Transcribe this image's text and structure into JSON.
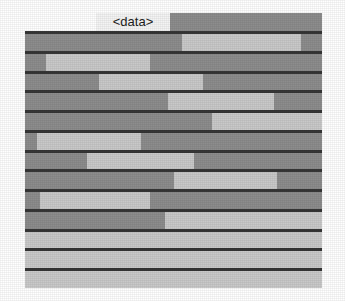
{
  "figure": {
    "label": "<data>",
    "colors": {
      "background": "#ffffff",
      "bar_dark": "#8d8d8d",
      "bar_light": "#c9c9c9",
      "separator": "#363636",
      "label_text": "#1c1c1c",
      "label_background": "#f4f4f4"
    }
  },
  "chart_data": {
    "type": "bar",
    "orientation": "horizontal",
    "title": "<data>",
    "subtitle": "",
    "xlabel": "",
    "ylabel": "",
    "xlim": [
      0,
      100
    ],
    "grid": false,
    "legend": false,
    "legend_position": "none",
    "note": "Stacked horizontal band chart: each of 13 rows spans 0-100% of the plot width and is divided into dark-gray and light-gray segments. Values are segment start/end positions as a percentage of the row width, read off the pixel boundaries.",
    "categories": [
      "row-1",
      "row-2",
      "row-3",
      "row-4",
      "row-5",
      "row-6",
      "row-7",
      "row-8",
      "row-9",
      "row-10",
      "row-11",
      "row-12",
      "row-13"
    ],
    "series": [
      {
        "name": "light-segment-start",
        "values": [
          53,
          7,
          25,
          48,
          63,
          4,
          21,
          50,
          5,
          47,
          0,
          0,
          0
        ]
      },
      {
        "name": "light-segment-end",
        "values": [
          93,
          42,
          60,
          84,
          100,
          39,
          57,
          85,
          42,
          100,
          100,
          100,
          100
        ]
      },
      {
        "name": "light-segment-width",
        "values": [
          40,
          35,
          35,
          36,
          37,
          35,
          36,
          35,
          37,
          53,
          100,
          100,
          100
        ]
      }
    ],
    "rows": [
      {
        "index": 1,
        "segments": [
          {
            "fill": "dark",
            "start": 0,
            "end": 53
          },
          {
            "fill": "light",
            "start": 53,
            "end": 93
          },
          {
            "fill": "dark",
            "start": 93,
            "end": 100
          }
        ]
      },
      {
        "index": 2,
        "segments": [
          {
            "fill": "dark",
            "start": 0,
            "end": 7
          },
          {
            "fill": "light",
            "start": 7,
            "end": 42
          },
          {
            "fill": "dark",
            "start": 42,
            "end": 100
          }
        ]
      },
      {
        "index": 3,
        "segments": [
          {
            "fill": "dark",
            "start": 0,
            "end": 25
          },
          {
            "fill": "light",
            "start": 25,
            "end": 60
          },
          {
            "fill": "dark",
            "start": 60,
            "end": 100
          }
        ]
      },
      {
        "index": 4,
        "segments": [
          {
            "fill": "dark",
            "start": 0,
            "end": 48
          },
          {
            "fill": "light",
            "start": 48,
            "end": 84
          },
          {
            "fill": "dark",
            "start": 84,
            "end": 100
          }
        ]
      },
      {
        "index": 5,
        "segments": [
          {
            "fill": "dark",
            "start": 0,
            "end": 63
          },
          {
            "fill": "light",
            "start": 63,
            "end": 100
          }
        ]
      },
      {
        "index": 6,
        "segments": [
          {
            "fill": "dark",
            "start": 0,
            "end": 4
          },
          {
            "fill": "light",
            "start": 4,
            "end": 39
          },
          {
            "fill": "dark",
            "start": 39,
            "end": 100
          }
        ]
      },
      {
        "index": 7,
        "segments": [
          {
            "fill": "dark",
            "start": 0,
            "end": 21
          },
          {
            "fill": "light",
            "start": 21,
            "end": 57
          },
          {
            "fill": "dark",
            "start": 57,
            "end": 100
          }
        ]
      },
      {
        "index": 8,
        "segments": [
          {
            "fill": "dark",
            "start": 0,
            "end": 50
          },
          {
            "fill": "light",
            "start": 50,
            "end": 85
          },
          {
            "fill": "dark",
            "start": 85,
            "end": 100
          }
        ]
      },
      {
        "index": 9,
        "segments": [
          {
            "fill": "dark",
            "start": 0,
            "end": 5
          },
          {
            "fill": "light",
            "start": 5,
            "end": 42
          },
          {
            "fill": "dark",
            "start": 42,
            "end": 100
          }
        ]
      },
      {
        "index": 10,
        "segments": [
          {
            "fill": "dark",
            "start": 0,
            "end": 47
          },
          {
            "fill": "light",
            "start": 47,
            "end": 100
          }
        ]
      },
      {
        "index": 11,
        "segments": [
          {
            "fill": "light",
            "start": 0,
            "end": 100
          }
        ]
      },
      {
        "index": 12,
        "segments": [
          {
            "fill": "light",
            "start": 0,
            "end": 100
          }
        ]
      },
      {
        "index": 13,
        "segments": [
          {
            "fill": "light",
            "start": 0,
            "end": 100
          }
        ]
      }
    ]
  }
}
